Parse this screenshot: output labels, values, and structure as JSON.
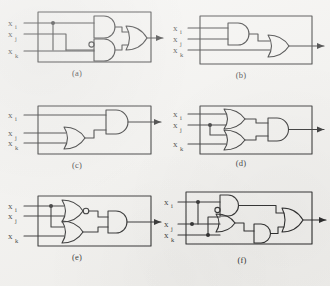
{
  "figure": {
    "type": "logic-gate-circuit-diagrams",
    "background_color": "#f2f1ee",
    "ink_color": "#1d1d1d",
    "panel_count": 6
  },
  "inputs": {
    "base": "x",
    "sub_i": "i",
    "sub_j": "j",
    "sub_k": "k"
  },
  "panels": [
    {
      "id": "a",
      "caption": "(a)",
      "inputs": [
        "x_i",
        "x_j",
        "x_k"
      ],
      "gates": [
        {
          "name": "and-gate-top",
          "type": "AND",
          "inputs": [
            "x_i",
            "x_j"
          ],
          "inverted_inputs": []
        },
        {
          "name": "and-gate-bottom",
          "type": "AND",
          "inputs": [
            "x_i",
            "x_k"
          ],
          "inverted_inputs": [
            "x_i"
          ]
        },
        {
          "name": "or-gate-output",
          "type": "OR",
          "inputs": [
            "and-gate-top",
            "and-gate-bottom"
          ]
        }
      ],
      "junctions": 1,
      "output": "arrow-right"
    },
    {
      "id": "b",
      "caption": "(b)",
      "inputs": [
        "x_i",
        "x_j",
        "x_k"
      ],
      "gates": [
        {
          "name": "and-gate",
          "type": "AND",
          "inputs": [
            "x_i",
            "x_j"
          ],
          "inverted_inputs": []
        },
        {
          "name": "or-gate-output",
          "type": "OR",
          "inputs": [
            "and-gate",
            "x_k"
          ]
        }
      ],
      "junctions": 0,
      "output": "arrow-right"
    },
    {
      "id": "c",
      "caption": "(c)",
      "inputs": [
        "x_i",
        "x_j",
        "x_k"
      ],
      "gates": [
        {
          "name": "or-gate",
          "type": "OR",
          "inputs": [
            "x_j",
            "x_k"
          ],
          "inverted_inputs": []
        },
        {
          "name": "and-gate-output",
          "type": "AND",
          "inputs": [
            "x_i",
            "or-gate"
          ]
        }
      ],
      "junctions": 0,
      "output": "arrow-right"
    },
    {
      "id": "d",
      "caption": "(d)",
      "inputs": [
        "x_i",
        "x_j",
        "x_k"
      ],
      "gates": [
        {
          "name": "or-gate-top",
          "type": "OR",
          "inputs": [
            "x_i",
            "x_j"
          ],
          "inverted_inputs": []
        },
        {
          "name": "or-gate-bottom",
          "type": "OR",
          "inputs": [
            "x_j",
            "x_k"
          ],
          "inverted_inputs": []
        },
        {
          "name": "and-gate-output",
          "type": "AND",
          "inputs": [
            "or-gate-top",
            "or-gate-bottom"
          ]
        }
      ],
      "junctions": 1,
      "output": "arrow-right"
    },
    {
      "id": "e",
      "caption": "(e)",
      "inputs": [
        "x_i",
        "x_j",
        "x_k"
      ],
      "gates": [
        {
          "name": "nor-gate-top",
          "type": "NOR",
          "inputs": [
            "x_i",
            "x_j"
          ],
          "inverted_output": true
        },
        {
          "name": "or-gate-bottom",
          "type": "OR",
          "inputs": [
            "x_i",
            "x_k"
          ],
          "inverted_inputs": []
        },
        {
          "name": "and-gate-output",
          "type": "AND",
          "inputs": [
            "nor-gate-top",
            "or-gate-bottom"
          ]
        }
      ],
      "junctions": 1,
      "output": "arrow-right"
    },
    {
      "id": "f",
      "caption": "(f)",
      "inputs": [
        "x_i",
        "x_j",
        "x_k"
      ],
      "gates": [
        {
          "name": "and-gate-top",
          "type": "AND",
          "inputs": [
            "x_i",
            "x_j"
          ],
          "inverted_inputs": [
            "x_j"
          ]
        },
        {
          "name": "or-gate-middle",
          "type": "OR",
          "inputs": [
            "x_i",
            "x_k"
          ],
          "inverted_inputs": []
        },
        {
          "name": "and-gate-lower",
          "type": "AND",
          "inputs": [
            "or-gate-middle",
            "x_k"
          ]
        },
        {
          "name": "or-gate-output",
          "type": "OR",
          "inputs": [
            "and-gate-top",
            "and-gate-lower"
          ]
        }
      ],
      "junctions": 3,
      "output": "arrow-right"
    }
  ]
}
